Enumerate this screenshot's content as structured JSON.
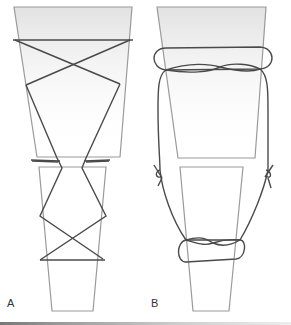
{
  "figure": {
    "panels": [
      {
        "id": "A",
        "label": "A",
        "description": "Figure-of-eight tension band wiring across two bone segments"
      },
      {
        "id": "B",
        "label": "B",
        "description": "Circumferential loop wiring with twisted knots at the sides"
      }
    ],
    "colors": {
      "bone_outline": "#9a9a9a",
      "wire": "#4a4a4a",
      "bone_top_gradient": "#e6e6e6",
      "background": "#ffffff"
    }
  }
}
